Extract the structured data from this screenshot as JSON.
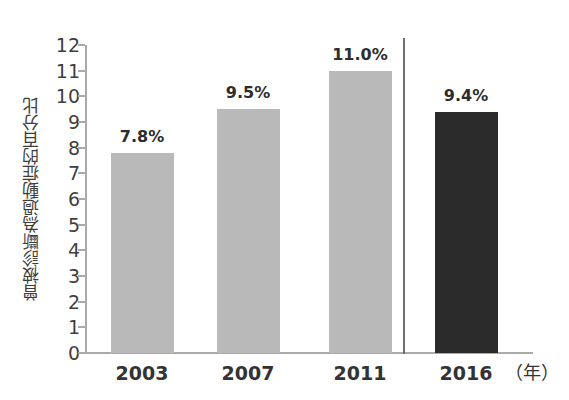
{
  "chart_data": {
    "type": "bar",
    "title": "",
    "subtitle": "",
    "xlabel": "（年）",
    "ylabel": "曾被診斷為過動症的百分比",
    "categories": [
      "2003",
      "2007",
      "2011",
      "2016"
    ],
    "values": [
      7.8,
      9.5,
      11.0,
      9.4
    ],
    "data_labels": [
      "7.8%",
      "9.5%",
      "11.0%",
      "9.4%"
    ],
    "ylim": [
      0,
      12
    ],
    "y_ticks": [
      "12",
      "11",
      "10",
      "9",
      "8",
      "7",
      "6",
      "5",
      "4",
      "3",
      "2",
      "1",
      "0"
    ],
    "y_tick_values": [
      12,
      11,
      10,
      9,
      8,
      7,
      6,
      5,
      4,
      3,
      2,
      1,
      0
    ],
    "grid": false,
    "legend": "none",
    "series": [
      {
        "name": "曾被診斷為過動症的百分比",
        "values": [
          7.8,
          9.5,
          11.0,
          9.4
        ],
        "bar_colors": [
          "#b9b9b9",
          "#b9b9b9",
          "#b9b9b9",
          "#2b2b2b"
        ]
      }
    ],
    "annotations": [
      {
        "name": "separator-line",
        "description": "vertical divider between 2011 and 2016 groups",
        "color": "#6d6d6d"
      }
    ],
    "colors": {
      "bar_light": "#b9b9b9",
      "bar_dark": "#2b2b2b",
      "axis": "#aaaaaa",
      "text": "#3f3f3f",
      "background": "#ffffff"
    }
  }
}
